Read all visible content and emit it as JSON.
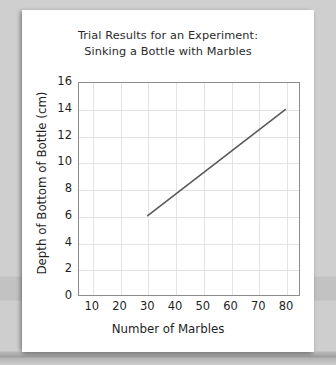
{
  "chart_data": {
    "type": "line",
    "title": "Trial Results for an Experiment: Sinking a Bottle with Marbles",
    "title_lines": [
      "Trial Results for an Experiment:",
      "Sinking a Bottle with Marbles"
    ],
    "xlabel": "Number of Marbles",
    "ylabel": "Depth of Bottom of Bottle (cm)",
    "x": [
      30,
      80
    ],
    "values": [
      6,
      14
    ],
    "series": [
      {
        "name": "Depth of bottom of bottle",
        "x": [
          30,
          80
        ],
        "values": [
          6,
          14
        ]
      }
    ],
    "xlim": [
      5,
      85
    ],
    "ylim": [
      0,
      16
    ],
    "xticks": [
      10,
      20,
      30,
      40,
      50,
      60,
      70,
      80
    ],
    "yticks": [
      0,
      2,
      4,
      6,
      8,
      10,
      12,
      14,
      16
    ],
    "xtick_labels": [
      "10",
      "20",
      "30",
      "40",
      "50",
      "60",
      "70",
      "80"
    ],
    "ytick_labels": [
      "0",
      "2",
      "4",
      "6",
      "8",
      "10",
      "12",
      "14",
      "16"
    ],
    "grid": true,
    "legend": "none",
    "line_color": "#595959",
    "grid_color": "#e3e3e3",
    "frame_color": "#8c8c8c",
    "text_color": "#1f1f1f",
    "paper_color": "#ffffff",
    "background_color": "#cccccc"
  }
}
